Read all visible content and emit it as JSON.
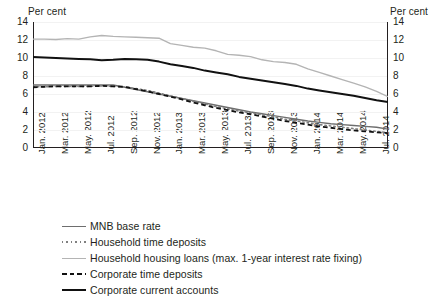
{
  "chart_data": {
    "type": "line",
    "title": "",
    "xlabel": "",
    "ylabel": "Per cent",
    "ylabel_left": "Per cent",
    "ylabel_right": "Per cent",
    "ylim": [
      0,
      14
    ],
    "yticks": [
      0,
      2,
      4,
      6,
      8,
      10,
      12,
      14
    ],
    "grid": false,
    "legend_position": "bottom-left",
    "categories": [
      "Jan. 2012",
      "Feb. 2012",
      "Mar. 2012",
      "Apr. 2012",
      "May. 2012",
      "Jun. 2012",
      "Jul. 2012",
      "Aug. 2012",
      "Sep. 2012",
      "Oct. 2012",
      "Nov. 2012",
      "Dec. 2012",
      "Jan. 2013",
      "Feb. 2013",
      "Mar. 2013",
      "Apr. 2013",
      "May. 2013",
      "Jun. 2013",
      "Jul. 2013",
      "Aug. 2013",
      "Sep. 2013",
      "Oct. 2013",
      "Nov. 2013",
      "Dec. 2013",
      "Jan. 2014",
      "Feb. 2014",
      "Mar. 2014",
      "Apr. 2014",
      "May. 2014",
      "Jun. 2014",
      "Jul. 2014",
      "Aug. 2014"
    ],
    "xtick_labels": [
      "Jan. 2012",
      "Mar. 2012",
      "May. 2012",
      "Jul. 2012",
      "Sep. 2012",
      "Nov. 2012",
      "Jan. 2013",
      "Mar. 2013",
      "May. 2013",
      "Jul. 2013",
      "Sep. 2013",
      "Nov. 2013",
      "Jan. 2014",
      "Mar. 2014",
      "May. 2014",
      "Jul. 2014"
    ],
    "series": [
      {
        "name": "MNB base rate",
        "color": "#6e6e6e",
        "style": "solid",
        "width": 1.4,
        "values": [
          7.0,
          7.0,
          7.0,
          7.0,
          7.0,
          7.0,
          7.0,
          7.0,
          6.75,
          6.5,
          6.25,
          6.0,
          5.75,
          5.5,
          5.25,
          5.0,
          4.75,
          4.5,
          4.25,
          4.0,
          3.8,
          3.6,
          3.4,
          3.2,
          3.0,
          2.85,
          2.7,
          2.6,
          2.5,
          2.4,
          2.3,
          2.1
        ]
      },
      {
        "name": "Household time deposits",
        "color": "#808080",
        "style": "dotted",
        "width": 1.6,
        "values": [
          6.8,
          6.8,
          6.85,
          6.85,
          6.85,
          6.85,
          6.9,
          6.85,
          6.8,
          6.6,
          6.4,
          6.1,
          5.8,
          5.5,
          5.2,
          4.9,
          4.6,
          4.35,
          4.1,
          3.9,
          3.7,
          3.45,
          3.2,
          3.0,
          2.8,
          2.6,
          2.45,
          2.3,
          2.15,
          2.0,
          1.85,
          1.7
        ]
      },
      {
        "name": "Household housing loans (max. 1-year interest rate fixing)",
        "color": "#b4b4b4",
        "style": "solid",
        "width": 1.4,
        "values": [
          12.1,
          12.1,
          12.05,
          12.15,
          12.1,
          12.35,
          12.5,
          12.4,
          12.35,
          12.3,
          12.25,
          12.2,
          11.6,
          11.4,
          11.2,
          11.1,
          10.8,
          10.4,
          10.3,
          10.15,
          9.8,
          9.6,
          9.5,
          9.3,
          8.8,
          8.4,
          8.0,
          7.6,
          7.2,
          6.8,
          6.3,
          5.7
        ]
      },
      {
        "name": "Corporate time deposits",
        "color": "#111111",
        "style": "dashed",
        "width": 1.8,
        "values": [
          6.75,
          6.8,
          6.85,
          6.85,
          6.85,
          6.85,
          6.9,
          6.85,
          6.8,
          6.55,
          6.3,
          6.0,
          5.7,
          5.4,
          5.05,
          4.75,
          4.45,
          4.2,
          3.95,
          3.75,
          3.5,
          3.25,
          3.0,
          2.8,
          2.6,
          2.4,
          2.25,
          2.1,
          1.95,
          1.85,
          1.75,
          1.65
        ]
      },
      {
        "name": "Corporate current accounts",
        "color": "#111111",
        "style": "solid",
        "width": 2.0,
        "values": [
          10.1,
          10.05,
          10.0,
          9.95,
          9.9,
          9.85,
          9.75,
          9.8,
          9.9,
          9.85,
          9.8,
          9.6,
          9.3,
          9.1,
          8.9,
          8.6,
          8.4,
          8.2,
          7.9,
          7.7,
          7.5,
          7.3,
          7.1,
          6.9,
          6.6,
          6.4,
          6.2,
          6.0,
          5.8,
          5.55,
          5.3,
          5.1
        ]
      }
    ]
  },
  "legend": [
    {
      "label": "MNB base rate"
    },
    {
      "label": "Household time deposits"
    },
    {
      "label": "Household housing loans (max. 1-year interest rate fixing)"
    },
    {
      "label": "Corporate time deposits"
    },
    {
      "label": "Corporate current accounts"
    }
  ]
}
